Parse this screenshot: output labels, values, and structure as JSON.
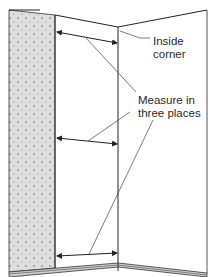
{
  "diagram": {
    "labels": {
      "inside_corner": [
        "Inside",
        "corner"
      ],
      "measure": [
        "Measure in",
        "three places"
      ]
    },
    "measurement_count": 3,
    "colors": {
      "line": "#222222",
      "panel_fill": "#dcdcdc",
      "panel_dots": "#8a8a8a",
      "baseboard": "#c8c8c8",
      "background": "#ffffff"
    }
  }
}
